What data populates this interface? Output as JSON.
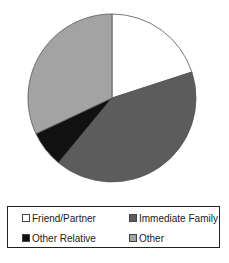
{
  "chart_data": {
    "type": "pie",
    "title": "",
    "categories": [
      "Friend/Partner",
      "Immediate Family",
      "Other Relative",
      "Other"
    ],
    "values": [
      20,
      41,
      7,
      32
    ],
    "unit": "%",
    "colors": [
      "#ffffff",
      "#5c5c5c",
      "#111111",
      "#a3a3a3"
    ],
    "start_angle_deg": 0,
    "direction": "clockwise",
    "legend": {
      "position": "bottom",
      "entries": [
        "Friend/Partner",
        "Immediate Family",
        "Other Relative",
        "Other"
      ]
    }
  },
  "legend": {
    "items": [
      {
        "label": "Friend/Partner",
        "color": "#ffffff"
      },
      {
        "label": "Immediate Family",
        "color": "#5c5c5c"
      },
      {
        "label": "Other Relative",
        "color": "#111111"
      },
      {
        "label": "Other",
        "color": "#a3a3a3"
      }
    ]
  }
}
